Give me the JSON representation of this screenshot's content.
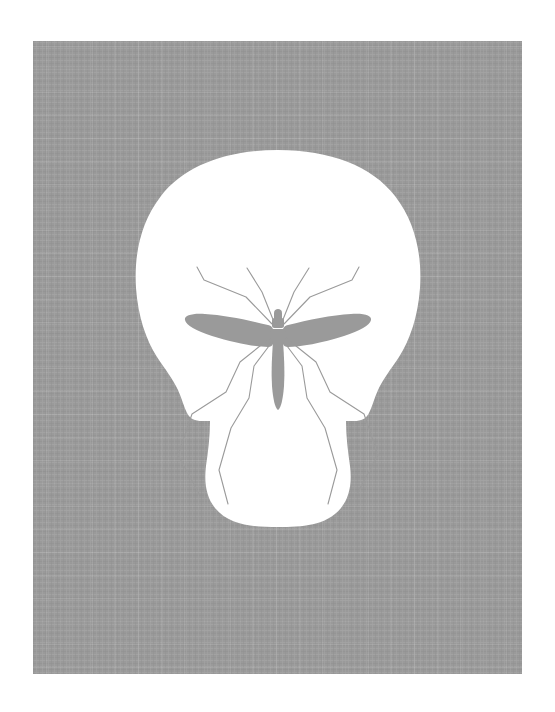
{
  "artwork": {
    "title": "Negative Space Skull / Crane Fly",
    "medium_look": "flat vector illustration on woven linen-textured gray panel",
    "alt_text": "A white human skull shape rendered as negative space on a gray textured panel; the skull's eye sockets, nasal cavity and jaw lines are formed by the gray silhouette of a crane fly or mosquito with outspread wings and splayed legs.",
    "canvas": {
      "width": 555,
      "height": 712,
      "background_color": "#ffffff"
    },
    "panel": {
      "name": "gray-textured-panel",
      "x": 33,
      "y": 41,
      "width": 489,
      "height": 633,
      "fill_color": "#9a9a9a",
      "texture": "woven-linen-weave",
      "texture_light": "#a6a6a6",
      "texture_dark": "#909090"
    },
    "skull": {
      "name": "negative-space-skull",
      "fill_color": "#ffffff",
      "center_x": 278,
      "cranium_top_y": 150,
      "chin_bottom_y": 525,
      "widest_left_x": 157,
      "widest_right_x": 399,
      "widest_y": 318
    },
    "insect": {
      "name": "crane-fly-silhouette",
      "fill_color": "#9a9a9a",
      "stroke_color": "#9a9a9a",
      "leg_stroke_width": 1.1,
      "thorax_center_x": 278,
      "thorax_center_y": 329,
      "wing_span_left_x": 185,
      "wing_span_right_x": 372,
      "abdomen_tip_y": 411,
      "upper_leg_count": 4,
      "lower_leg_count": 4
    }
  },
  "chart_data": {
    "type": "scatter",
    "xlabel": "",
    "ylabel": "",
    "xlim": [
      0,
      555
    ],
    "ylim": [
      712,
      0
    ],
    "grid": false,
    "legend": "none",
    "annotations": [
      "skull rendered in white negative space",
      "crane fly body forms nasal cavity",
      "crane fly wings form the eye sockets",
      "crane fly legs form the cheek and jaw contour lines"
    ],
    "series": [
      {
        "name": "panel-corners",
        "x": [
          33,
          522,
          522,
          33
        ],
        "y": [
          41,
          41,
          674,
          674
        ]
      },
      {
        "name": "skull-landmarks",
        "x": [
          278,
          157,
          399,
          278
        ],
        "y": [
          150,
          318,
          318,
          525
        ]
      },
      {
        "name": "insect-landmarks",
        "x": [
          278,
          185,
          372,
          278
        ],
        "y": [
          329,
          321,
          321,
          411
        ]
      }
    ]
  }
}
